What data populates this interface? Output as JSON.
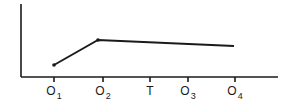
{
  "chart_data": {
    "type": "line",
    "title": "",
    "xlabel": "",
    "ylabel": "",
    "grid": false,
    "legend": null,
    "categories": [
      "O1",
      "O2",
      "T",
      "O3",
      "O4"
    ],
    "tick_labels": [
      {
        "main": "O",
        "sub": "1",
        "x": 54
      },
      {
        "main": "O",
        "sub": "2",
        "x": 103
      },
      {
        "main": "T",
        "sub": "",
        "x": 150
      },
      {
        "main": "O",
        "sub": "3",
        "x": 188
      },
      {
        "main": "O",
        "sub": "4",
        "x": 235
      }
    ],
    "series": [
      {
        "name": "observations",
        "points": [
          {
            "label": "O1",
            "x": 54,
            "y": 65,
            "marker": true
          },
          {
            "label": "O2",
            "x": 98,
            "y": 40,
            "marker": true
          },
          {
            "label": "O4",
            "x": 234,
            "y": 46,
            "marker": false
          }
        ]
      }
    ],
    "axes": {
      "origin": {
        "x": 21,
        "y": 77
      },
      "y_top": 4,
      "x_end": 278
    },
    "annotations": "Interrupted time-series design: pretest O1, O2, treatment T, posttest O3, O4"
  },
  "colors": {
    "ink": "#1a1a1a",
    "background": "#ffffff"
  }
}
